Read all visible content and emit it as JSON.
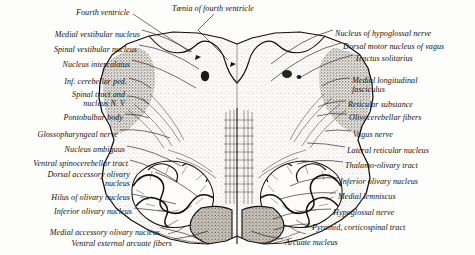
{
  "figure": {
    "orientation": "dorsal surface at top, ventral surface at bottom",
    "background_color": "#fdfdfb",
    "ink_color": "#16120e"
  },
  "labels_top": [
    {
      "id": "fourth-ventricle",
      "text": "Fourth ventricle",
      "x": 76,
      "y": 8,
      "align": "left"
    },
    {
      "id": "taenia-of-fourth-ventricle",
      "text": "Tænia of fourth ventricle",
      "x": 172,
      "y": 4,
      "align": "left"
    }
  ],
  "labels_left": [
    {
      "id": "medial-vestibular-nucleus",
      "text": "Medial vestibular nucleus",
      "x": 140,
      "y": 30,
      "align": "right"
    },
    {
      "id": "spinal-vestibular-nucleus",
      "text": "Spinal vestibular nucleus",
      "x": 137,
      "y": 45,
      "align": "right"
    },
    {
      "id": "nucleus-intercalatus",
      "text": "Nucleus intercalatus",
      "x": 130,
      "y": 60,
      "align": "right"
    },
    {
      "id": "inf-cerebellar-ped",
      "text": "Inf. cerebellar ped.",
      "x": 127,
      "y": 77,
      "align": "right"
    },
    {
      "id": "spinal-tract-and-nucleus-n-v",
      "text": "Spinal tract and\nnucleus N. V",
      "x": 125,
      "y": 90,
      "align": "right"
    },
    {
      "id": "pontobulbar-body",
      "text": "Pontobulbar body",
      "x": 123,
      "y": 113,
      "align": "right"
    },
    {
      "id": "glossopharyngeal-nerve",
      "text": "Glossopharyngeal nerve",
      "x": 118,
      "y": 130,
      "align": "right"
    },
    {
      "id": "nucleus-ambiguus",
      "text": "Nucleus ambiguus",
      "x": 125,
      "y": 145,
      "align": "right"
    },
    {
      "id": "ventral-spinocerebellar-tract",
      "text": "Ventral spinocerebellar tract",
      "x": 128,
      "y": 159,
      "align": "right"
    },
    {
      "id": "dorsal-accessory-olivary-nucleus",
      "text": "Dorsal accessory olivary\nnucleus",
      "x": 130,
      "y": 170,
      "align": "right"
    },
    {
      "id": "hilus-of-olivary-nucleus",
      "text": "Hilus of olivary nucleus",
      "x": 130,
      "y": 193,
      "align": "right"
    },
    {
      "id": "inferior-olivary-nucleus-left",
      "text": "Inferior olivary nucleus",
      "x": 132,
      "y": 207,
      "align": "right"
    },
    {
      "id": "medial-accessory-olivary-nucleus",
      "text": "Medial accessory olivary nucleus",
      "x": 160,
      "y": 228,
      "align": "right"
    },
    {
      "id": "ventral-external-arcuate-fibers",
      "text": "Ventral external arcuate fibers",
      "x": 172,
      "y": 239,
      "align": "right"
    }
  ],
  "labels_right": [
    {
      "id": "nucleus-of-hypoglossal-nerve",
      "text": "Nucleus of hypoglossal nerve",
      "x": 335,
      "y": 29,
      "align": "left"
    },
    {
      "id": "dorsal-motor-nucleus-of-vagus",
      "text": "Dorsal motor nucleus of vagus",
      "x": 343,
      "y": 42,
      "align": "left"
    },
    {
      "id": "tractus-solitarius",
      "text": "Tractus solitarius",
      "x": 355,
      "y": 54,
      "align": "left"
    },
    {
      "id": "medial-longitudinal-fasciculus",
      "text": "Medial longitudinal\nfasciculus",
      "x": 352,
      "y": 76,
      "align": "left"
    },
    {
      "id": "reticular-substance",
      "text": "Reticular substance",
      "x": 348,
      "y": 100,
      "align": "left"
    },
    {
      "id": "olivocerebellar-fibers",
      "text": "Olivocerebellar fibers",
      "x": 349,
      "y": 113,
      "align": "left"
    },
    {
      "id": "vagus-nerve",
      "text": "Vagus nerve",
      "x": 353,
      "y": 130,
      "align": "left"
    },
    {
      "id": "lateral-reticular-nucleus",
      "text": "Lateral reticular nucleus",
      "x": 347,
      "y": 146,
      "align": "left"
    },
    {
      "id": "thalamo-olivary-tract",
      "text": "Thalamo-olivary tract",
      "x": 345,
      "y": 161,
      "align": "left"
    },
    {
      "id": "inferior-olivary-nucleus-right",
      "text": "Inferior olivary nucleus",
      "x": 340,
      "y": 177,
      "align": "left"
    },
    {
      "id": "medial-lemniscus",
      "text": "Medial lemniscus",
      "x": 338,
      "y": 192,
      "align": "left"
    },
    {
      "id": "hypoglossal-nerve",
      "text": "Hypoglossal nerve",
      "x": 333,
      "y": 208,
      "align": "left"
    },
    {
      "id": "pyramid-corticospinal-tract",
      "text": "Pyramid, corticospinal tract",
      "x": 312,
      "y": 223,
      "align": "left"
    },
    {
      "id": "arcuate-nucleus",
      "text": "Arcuate nucleus",
      "x": 285,
      "y": 238,
      "align": "left"
    }
  ]
}
